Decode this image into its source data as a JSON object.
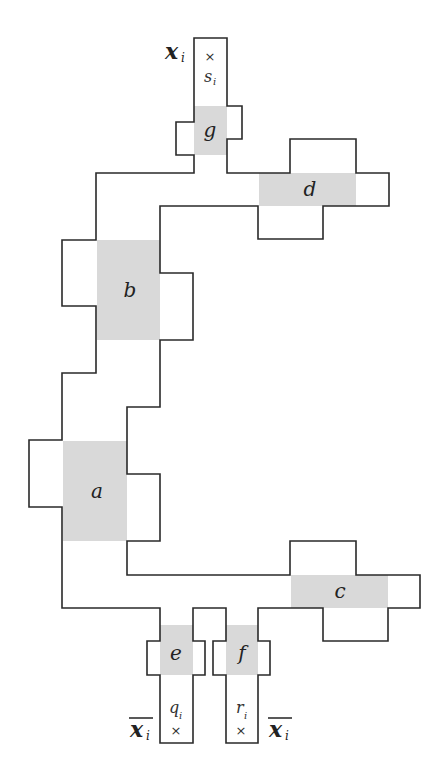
{
  "diagram": {
    "style": {
      "outline_color": "#2a2a2a",
      "shade_color": "#d9d9d9",
      "background": "#ffffff"
    },
    "regions": [
      {
        "id": "g",
        "label": "g"
      },
      {
        "id": "d",
        "label": "d"
      },
      {
        "id": "b",
        "label": "b"
      },
      {
        "id": "a",
        "label": "a"
      },
      {
        "id": "c",
        "label": "c"
      },
      {
        "id": "e",
        "label": "e"
      },
      {
        "id": "f",
        "label": "f"
      }
    ],
    "terminals": {
      "top": {
        "var": "x",
        "sub": "i",
        "overline": false,
        "point": "s",
        "point_sub": "i",
        "marker": "×"
      },
      "bottom_left": {
        "var": "x",
        "sub": "i",
        "overline": true,
        "point": "q",
        "point_sub": "i",
        "marker": "×"
      },
      "bottom_right": {
        "var": "x",
        "sub": "i",
        "overline": true,
        "point": "r",
        "point_sub": "i",
        "marker": "×"
      }
    }
  }
}
